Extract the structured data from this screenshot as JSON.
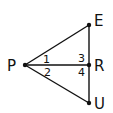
{
  "diagram": {
    "type": "geometry-figure",
    "points": {
      "P": {
        "label": "P",
        "x": 25,
        "y": 65
      },
      "E": {
        "label": "E",
        "x": 89,
        "y": 25
      },
      "R": {
        "label": "R",
        "x": 89,
        "y": 65
      },
      "U": {
        "label": "U",
        "x": 89,
        "y": 103
      }
    },
    "segments": [
      {
        "from": "P",
        "to": "E"
      },
      {
        "from": "P",
        "to": "R"
      },
      {
        "from": "P",
        "to": "U"
      },
      {
        "from": "E",
        "to": "U"
      }
    ],
    "angle_labels": [
      {
        "label": "1",
        "position": "at P, between PE and PR"
      },
      {
        "label": "2",
        "position": "at P, between PR and PU"
      },
      {
        "label": "3",
        "position": "at R, between RE and RP"
      },
      {
        "label": "4",
        "position": "at R, between RP and RU"
      }
    ],
    "colors": {
      "line": "#111111",
      "background": "#ffffff"
    }
  }
}
